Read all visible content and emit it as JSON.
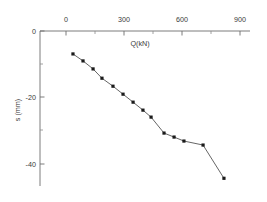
{
  "chart_data": {
    "type": "line",
    "title": "",
    "subtitle": "",
    "xlabel": "Q(kN)",
    "ylabel": "s (mm)",
    "xlim": [
      -30,
      930
    ],
    "ylim": [
      -46,
      0
    ],
    "x_axis_position": "top",
    "y_axis_position": "left",
    "grid": false,
    "legend": null,
    "legend_position": "none",
    "x_ticks": [
      0,
      300,
      600,
      900
    ],
    "x_tick_labels": [
      "0",
      "300",
      "600",
      "900"
    ],
    "x_minor_ticks": [
      150,
      450,
      750
    ],
    "y_ticks": [
      0,
      -20,
      -40
    ],
    "y_tick_labels": [
      "0",
      "-20",
      "-40"
    ],
    "y_minor_ticks": [
      -10,
      -30
    ],
    "marker": "square",
    "marker_color": "#1a1a1a",
    "line_color": "#4a4a4a",
    "series": [
      {
        "name": "load-settlement",
        "x": [
          36,
          88,
          140,
          186,
          243,
          295,
          347,
          398,
          440,
          507,
          559,
          610,
          709,
          817
        ],
        "y": [
          -6.9,
          -9.0,
          -11.4,
          -14.2,
          -16.6,
          -19.0,
          -21.4,
          -23.8,
          -25.9,
          -30.7,
          -31.9,
          -33.1,
          -34.3,
          -44.3
        ]
      }
    ]
  },
  "axes": {
    "x_title": "Q(kN)",
    "y_title": "s (mm)"
  }
}
